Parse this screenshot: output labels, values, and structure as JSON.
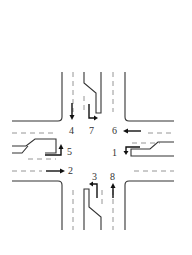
{
  "diagram": {
    "type": "four-leg intersection movement numbering",
    "colors": {
      "lines": "#333333",
      "lane_dashes": "#8a8a8a",
      "arrows": "#111111",
      "background": "#ffffff"
    },
    "movements": [
      {
        "id": "1",
        "label": "1",
        "approach": "eastbound-right-side (from east)",
        "turn": "left"
      },
      {
        "id": "2",
        "label": "2",
        "approach": "from west",
        "turn": "through"
      },
      {
        "id": "3",
        "label": "3",
        "approach": "from south",
        "turn": "left"
      },
      {
        "id": "4",
        "label": "4",
        "approach": "from north",
        "turn": "through"
      },
      {
        "id": "5",
        "label": "5",
        "approach": "from west",
        "turn": "left"
      },
      {
        "id": "6",
        "label": "6",
        "approach": "from east",
        "turn": "through"
      },
      {
        "id": "7",
        "label": "7",
        "approach": "from north",
        "turn": "left"
      },
      {
        "id": "8",
        "label": "8",
        "approach": "from south",
        "turn": "through"
      }
    ]
  }
}
